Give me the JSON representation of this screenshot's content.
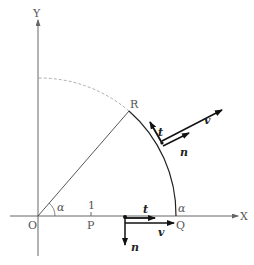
{
  "labels": {
    "y_axis": "Y",
    "x_axis": "X",
    "origin": "O",
    "point_r": "R",
    "point_p": "P",
    "point_q": "Q",
    "tick_one": "1",
    "angle_alpha_origin": "α",
    "angle_alpha_q": "α",
    "vec_t_upper": "t",
    "vec_n_upper": "n",
    "vec_v_upper": "v",
    "vec_t_lower": "t",
    "vec_v_lower": "v",
    "vec_n_lower": "n"
  },
  "colors": {
    "axis": "#666666",
    "curve": "#222222",
    "dashed": "#999999",
    "vector": "#111111"
  }
}
